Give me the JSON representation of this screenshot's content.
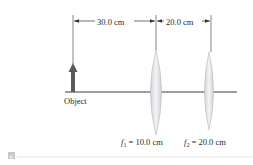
{
  "figure": {
    "dimension_1": "30.0 cm",
    "dimension_2": "20.0 cm",
    "object_label": "Object",
    "lens1_label_f": "f",
    "lens1_label_sub": "1",
    "lens1_label_value": " = 10.0 cm",
    "lens2_label_f": "f",
    "lens2_label_sub": "2",
    "lens2_label_value": " = 20.0 cm",
    "panel_label": "a"
  },
  "colors": {
    "axis": "#3a3a3a",
    "arrow": "#5a5a5a",
    "lens_fill": "#e6e6ea",
    "lens_stroke": "#b8b8c0"
  }
}
